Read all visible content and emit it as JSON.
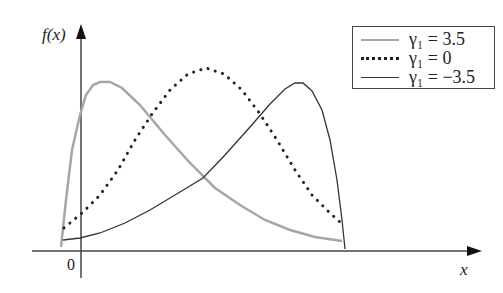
{
  "chart_data": {
    "type": "line",
    "title": "",
    "xlabel": "x",
    "ylabel": "f(x)",
    "origin_label": "0",
    "grid": false,
    "legend_position": "upper right",
    "series": [
      {
        "name": "γ1 = 3.5",
        "style": "solid",
        "color": "#a6a6a6",
        "points": [
          [
            61,
            247
          ],
          [
            66,
            200
          ],
          [
            72,
            150
          ],
          [
            80,
            115
          ],
          [
            86,
            95
          ],
          [
            93,
            85
          ],
          [
            100,
            82
          ],
          [
            110,
            82
          ],
          [
            122,
            88
          ],
          [
            140,
            105
          ],
          [
            165,
            135
          ],
          [
            190,
            163
          ],
          [
            215,
            188
          ],
          [
            240,
            205
          ],
          [
            265,
            220
          ],
          [
            290,
            230
          ],
          [
            315,
            237
          ],
          [
            342,
            241
          ]
        ]
      },
      {
        "name": "γ1 = 0",
        "style": "dotted",
        "color": "#222222",
        "points": [
          [
            64,
            228
          ],
          [
            82,
            213
          ],
          [
            100,
            195
          ],
          [
            118,
            170
          ],
          [
            135,
            140
          ],
          [
            152,
            114
          ],
          [
            170,
            90
          ],
          [
            188,
            74
          ],
          [
            206,
            68
          ],
          [
            224,
            74
          ],
          [
            242,
            90
          ],
          [
            260,
            114
          ],
          [
            277,
            140
          ],
          [
            295,
            170
          ],
          [
            312,
            195
          ],
          [
            330,
            213
          ],
          [
            341,
            223
          ]
        ]
      },
      {
        "name": "γ1 = -3.5",
        "style": "solid",
        "color": "#333333",
        "points": [
          [
            63,
            240
          ],
          [
            80,
            238
          ],
          [
            100,
            233
          ],
          [
            125,
            223
          ],
          [
            150,
            210
          ],
          [
            175,
            195
          ],
          [
            203,
            178
          ],
          [
            225,
            155
          ],
          [
            250,
            127
          ],
          [
            270,
            104
          ],
          [
            285,
            89
          ],
          [
            295,
            83
          ],
          [
            303,
            83
          ],
          [
            312,
            91
          ],
          [
            322,
            110
          ],
          [
            330,
            140
          ],
          [
            337,
            180
          ],
          [
            342,
            220
          ],
          [
            345,
            249
          ]
        ]
      }
    ]
  },
  "legend": {
    "items": [
      {
        "label": "γ₁ = 3.5"
      },
      {
        "label": "γ₁ = 0"
      },
      {
        "label": "γ₁ = −3.5"
      }
    ]
  }
}
